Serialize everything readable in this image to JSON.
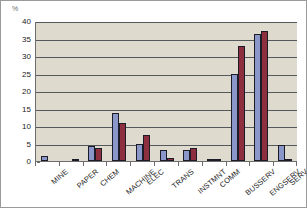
{
  "chart": {
    "y_unit_label": "%",
    "y_ticks": [
      "40",
      "35",
      "30",
      "25",
      "20",
      "15",
      "10",
      "5",
      "0"
    ],
    "colors": {
      "series_1": "#8b97c9",
      "series_2": "#8e2f3f",
      "plot_background": "#dedacd",
      "gridline": "#55585c",
      "axis": "#6d6d6d",
      "bar_outline": "#1c1c28",
      "page_background": "#ffffff"
    }
  },
  "chart_data": {
    "type": "bar",
    "title": "",
    "xlabel": "",
    "ylabel": "%",
    "ylim": [
      0,
      40
    ],
    "ytick_step": 5,
    "grid": true,
    "legend": "none",
    "categories": [
      "MINE",
      "PAPER",
      "CHEM",
      "MACHINE",
      "ELEC",
      "TRANS",
      "INSTMNT",
      "COMM",
      "BUSSERV",
      "ENGSERV",
      "SERV"
    ],
    "series": [
      {
        "name": "Series 1",
        "color": "#8b97c9",
        "values": [
          1.5,
          0,
          4.2,
          13.6,
          4.8,
          3.1,
          3.1,
          0.7,
          25.0,
          36.2,
          4.5
        ]
      },
      {
        "name": "Series 2",
        "color": "#8e2f3f",
        "values": [
          0,
          0.3,
          3.7,
          10.8,
          7.5,
          0.8,
          3.7,
          0.7,
          33.0,
          37.2,
          0.6
        ]
      }
    ]
  }
}
